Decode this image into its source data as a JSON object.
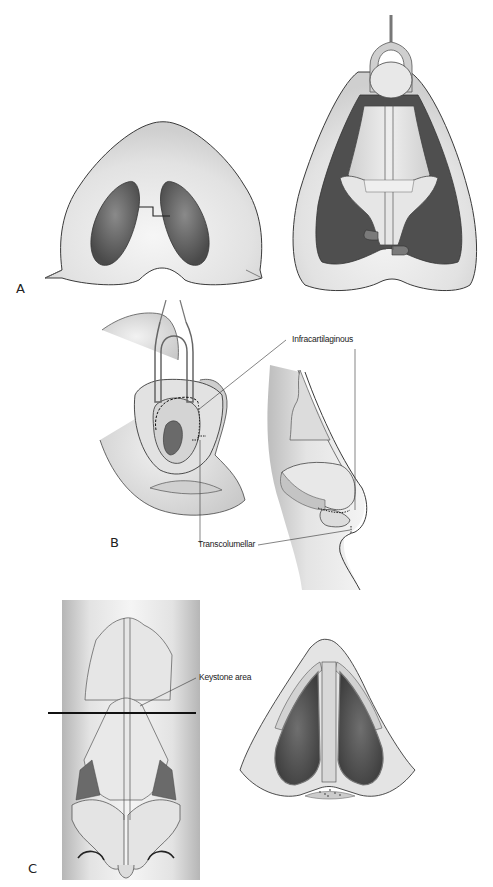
{
  "figure": {
    "panels": [
      {
        "id": "A",
        "letter": "A",
        "views": [
          "basal view with stair-step columellar incision",
          "open approach with retracted skin flap exposing lower lateral cartilages"
        ]
      },
      {
        "id": "B",
        "letter": "B",
        "views": [
          "oblique view with retractor and incision lines",
          "lateral profile with incision lines"
        ],
        "labels": {
          "infracartilaginous": "Infracartilaginous",
          "transcolumellar": "Transcolumellar"
        }
      },
      {
        "id": "C",
        "letter": "C",
        "views": [
          "frontal view of nasal skeleton with section line",
          "cross-section at keystone level"
        ],
        "labels": {
          "keystone": "Keystone area"
        }
      }
    ],
    "colors": {
      "skin": "#e4e4e4",
      "skin_shadow": "#c8c8c8",
      "outline": "#3a3a3a",
      "cavity": "#5a5a5a",
      "cartilage": "#d6d6d6",
      "section_line": "#111111"
    }
  }
}
